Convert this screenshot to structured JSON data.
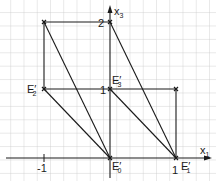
{
  "diagram": {
    "axes": {
      "horizontal_label": "x",
      "horizontal_sub": "1",
      "vertical_label": "x",
      "vertical_sub": "3",
      "ticks": {
        "x_neg1": "-1",
        "x_1": "1",
        "y_1": "1",
        "y_2": "2"
      }
    },
    "points": {
      "E0": {
        "label": "E",
        "sub": "0",
        "prime": "′"
      },
      "E1": {
        "label": "E",
        "sub": "1",
        "prime": "′"
      },
      "E2": {
        "label": "E",
        "sub": "2",
        "prime": "′"
      },
      "E3": {
        "label": "E",
        "sub": "3",
        "prime": "′"
      }
    },
    "colors": {
      "grid": "#c8c8c8",
      "lines": "#1a1a1a",
      "background": "#ffffff"
    }
  }
}
